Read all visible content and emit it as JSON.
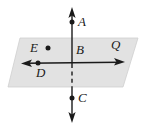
{
  "figure": {
    "type": "geometry-diagram",
    "background_color": "#ffffff",
    "plane": {
      "name": "Q",
      "fill_color": "#e2e2e2",
      "stroke_color": "#c9c9c9",
      "corners": [
        {
          "x": 20,
          "y": 38
        },
        {
          "x": 138,
          "y": 38
        },
        {
          "x": 123,
          "y": 87
        },
        {
          "x": 8,
          "y": 87
        }
      ]
    },
    "lines": {
      "vertical": {
        "label": "vertical-line-ABC",
        "color": "#1a1a1a",
        "x": 72,
        "y_top": 8,
        "y_bottom": 122,
        "dashed_segment": {
          "y_start": 64,
          "y_end": 87
        },
        "arrow_top": true,
        "arrow_bottom": true
      },
      "horizontal": {
        "label": "horizontal-line-DBQ",
        "color": "#1a1a1a",
        "y": 63,
        "x_left": 22,
        "x_right": 124,
        "arrow_left": true,
        "arrow_right": true
      }
    },
    "points": [
      {
        "id": "A",
        "label": "A",
        "dot": true,
        "dot_x": 72,
        "dot_y": 22,
        "label_x": 78,
        "label_y": 17
      },
      {
        "id": "B",
        "label": "B",
        "dot": false,
        "dot_x": 72,
        "dot_y": 63,
        "label_x": 76,
        "label_y": 44
      },
      {
        "id": "C",
        "label": "C",
        "dot": true,
        "dot_x": 72,
        "dot_y": 98,
        "label_x": 78,
        "label_y": 92
      },
      {
        "id": "D",
        "label": "D",
        "dot": true,
        "dot_x": 38,
        "dot_y": 63,
        "label_x": 37,
        "label_y": 67
      },
      {
        "id": "E",
        "label": "E",
        "dot": true,
        "dot_x": 48,
        "dot_y": 48,
        "label_x": 31,
        "label_y": 42
      },
      {
        "id": "Q",
        "label": "Q",
        "dot": false,
        "dot_x": 0,
        "dot_y": 0,
        "label_x": 112,
        "label_y": 39
      }
    ]
  }
}
